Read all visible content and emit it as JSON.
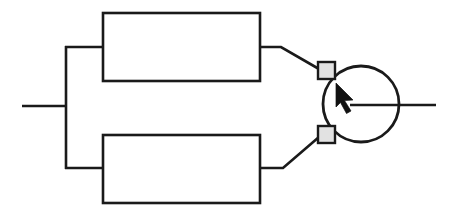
{
  "diagram": {
    "type": "block-schematic",
    "canvas": {
      "width": 458,
      "height": 213,
      "background": "#ffffff"
    },
    "colors": {
      "line": "#1a1a1a",
      "block_fill": "#ffffff",
      "terminal_fill": "#e2e2e2",
      "cursor_fill": "#111111",
      "background": "#ffffff"
    },
    "style": {
      "wire_stroke_width": 2.6,
      "block_stroke_width": 2.6,
      "circle_stroke_width": 2.8,
      "terminal_stroke_width": 2.4
    },
    "elements": {
      "input_line": {
        "label": "",
        "x1": 22,
        "y1": 106,
        "x2": 66,
        "y2": 106
      },
      "split_bus": {
        "label": "",
        "x": 66,
        "y_top": 47,
        "y_bottom": 168
      },
      "branch_top": {
        "label": "",
        "x1": 66,
        "y1": 47,
        "x2": 103,
        "y2": 47
      },
      "branch_bottom": {
        "label": "",
        "x1": 66,
        "y1": 168,
        "x2": 103,
        "y2": 168
      },
      "block_top": {
        "label": "",
        "x": 103,
        "y": 13,
        "width": 157,
        "height": 68
      },
      "block_bottom": {
        "label": "",
        "x": 103,
        "y": 135,
        "width": 157,
        "height": 68
      },
      "lead_top": {
        "label": "",
        "points": "260,47 281,47 318,70"
      },
      "lead_bottom": {
        "label": "",
        "points": "260,168 283,168 318,135"
      },
      "terminal_top": {
        "label": "",
        "x": 318,
        "y": 62,
        "width": 17,
        "height": 17
      },
      "terminal_bottom": {
        "label": "",
        "x": 318,
        "y": 126,
        "width": 17,
        "height": 17
      },
      "circle_node": {
        "label": "",
        "cx": 361,
        "cy": 104,
        "r": 38
      },
      "cursor_arrow": {
        "label": "",
        "tip_x": 336,
        "tip_y": 83,
        "direction": "up-left",
        "points": "336,83 352,99 344,100 350,110 346,112 341,102 336,106"
      },
      "output_line": {
        "label": "",
        "x1": 350,
        "y1": 105,
        "x2": 436,
        "y2": 105
      }
    }
  }
}
